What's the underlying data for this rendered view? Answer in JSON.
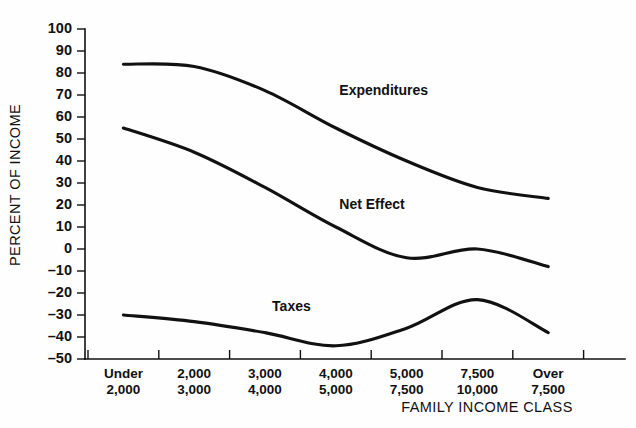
{
  "chart_data": {
    "type": "line",
    "title": "",
    "xlabel": "FAMILY INCOME CLASS",
    "ylabel": "PERCENT OF INCOME",
    "ylim": [
      -50,
      100
    ],
    "ytick_step": 10,
    "grid": false,
    "legend_position": "inline-labels",
    "categories": [
      "Under 2,000",
      "2,000 3,000",
      "3,000 4,000",
      "4,000 5,000",
      "5,000 7,500",
      "7,500 10,000",
      "Over 7,500"
    ],
    "category_lines": [
      {
        "top": "Under",
        "bottom": "2,000"
      },
      {
        "top": "2,000",
        "bottom": "3,000"
      },
      {
        "top": "3,000",
        "bottom": "4,000"
      },
      {
        "top": "4,000",
        "bottom": "5,000"
      },
      {
        "top": "5,000",
        "bottom": "7,500"
      },
      {
        "top": "7,500",
        "bottom": "10,000"
      },
      {
        "top": "Over",
        "bottom": "7,500"
      }
    ],
    "yticks": [
      100,
      90,
      80,
      70,
      60,
      50,
      40,
      30,
      20,
      10,
      0,
      -10,
      -20,
      -30,
      -40,
      -50
    ],
    "ytick_labels": [
      "100",
      "90",
      "80",
      "70",
      "60",
      "50",
      "40",
      "30",
      "20",
      "10",
      "0",
      "–10",
      "–20",
      "–30",
      "–40",
      "–50"
    ],
    "series": [
      {
        "name": "Expenditures",
        "label": "Expenditures",
        "color": "#111111",
        "values": [
          84,
          83,
          72,
          55,
          40,
          28,
          23
        ],
        "label_point": {
          "x": 3.05,
          "y": 70
        }
      },
      {
        "name": "Net Effect",
        "label": "Net Effect",
        "color": "#111111",
        "values": [
          55,
          44,
          28,
          10,
          -4,
          0,
          -8
        ],
        "label_point": {
          "x": 3.05,
          "y": 18
        }
      },
      {
        "name": "Taxes",
        "label": "Taxes",
        "color": "#111111",
        "values": [
          -30,
          -33,
          -38,
          -44,
          -36,
          -23,
          -38
        ],
        "label_point": {
          "x": 2.1,
          "y": -28
        }
      }
    ]
  },
  "axis": {
    "y_title": "PERCENT OF INCOME",
    "x_title": "FAMILY INCOME CLASS"
  }
}
